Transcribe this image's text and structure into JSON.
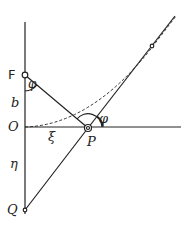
{
  "diagram": {
    "labels": {
      "F": "F",
      "phi_top": "φ",
      "b": "b",
      "O": "O",
      "xi": "ξ",
      "P": "P",
      "phi_right": "φ",
      "eta": "η",
      "Q": "Q"
    },
    "colors": {
      "ink": "#222222",
      "background": "#ffffff"
    }
  }
}
